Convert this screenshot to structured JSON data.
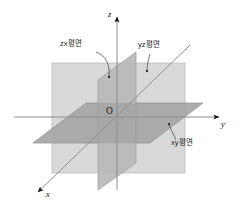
{
  "figure": {
    "background_color": "#ffffff"
  },
  "axes": {
    "z": {
      "label": "z",
      "direction": "up"
    },
    "y": {
      "label": "y",
      "direction": "right"
    },
    "x": {
      "label": "x",
      "direction": "down-left"
    },
    "origin_label": "O",
    "axis_color": "#8a8a8a",
    "arrow_color": "#111111"
  },
  "planes": [
    {
      "id": "yz-plane",
      "label": "yz평면",
      "fill": "#d7d7d7",
      "note": "large light rectangle, front-facing"
    },
    {
      "id": "zx-plane",
      "label": "zx평면",
      "fill": "#bfbfbf",
      "note": "vertical receding parallelogram"
    },
    {
      "id": "xy-plane",
      "label": "xy평면",
      "fill": "#a3a3a3",
      "note": "horizontal receding parallelogram"
    }
  ],
  "callouts": [
    {
      "id": "zx-callout",
      "text": "zx평면",
      "x": 62,
      "y": 44
    },
    {
      "id": "yz-callout",
      "text": "yz평면",
      "x": 140,
      "y": 45
    },
    {
      "id": "xy-callout",
      "text": "xy평면",
      "x": 172,
      "y": 143
    }
  ]
}
